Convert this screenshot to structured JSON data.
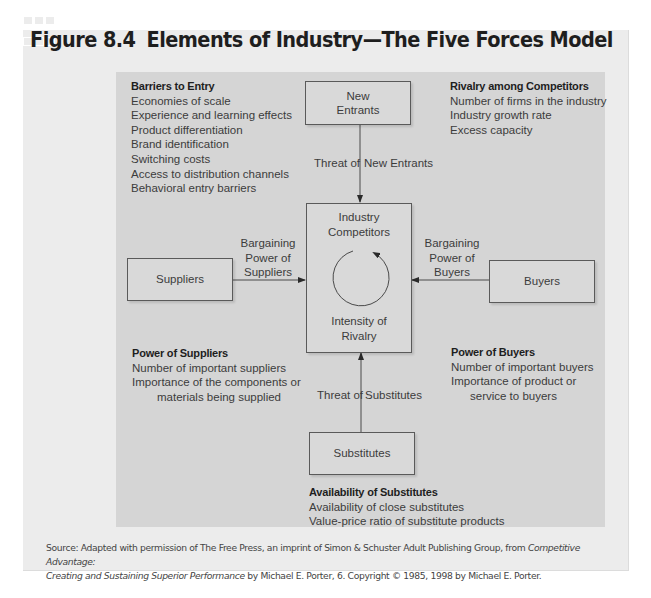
{
  "figure": {
    "number": "Figure 8.4",
    "title": "Elements of Industry—The Five Forces Model"
  },
  "nodes": {
    "new_entrants": [
      "New",
      "Entrants"
    ],
    "industry_competitors": [
      "Industry",
      "Competitors"
    ],
    "intensity": [
      "Intensity of",
      "Rivalry"
    ],
    "suppliers": "Suppliers",
    "buyers": "Buyers",
    "substitutes": "Substitutes"
  },
  "edges": {
    "threat_new_entrants": {
      "left": "Threat of",
      "right": "New Entrants"
    },
    "bargaining_suppliers": [
      "Bargaining",
      "Power of",
      "Suppliers"
    ],
    "bargaining_buyers": [
      "Bargaining",
      "Power of",
      "Buyers"
    ],
    "threat_substitutes": {
      "left": "Threat of",
      "right": "Substitutes"
    }
  },
  "lists": {
    "barriers_to_entry": {
      "heading": "Barriers to Entry",
      "items": [
        "Economies of scale",
        "Experience and learning effects",
        "Product differentiation",
        "Brand identification",
        "Switching costs",
        "Access to distribution channels",
        "Behavioral entry barriers"
      ]
    },
    "rivalry": {
      "heading": "Rivalry among Competitors",
      "items": [
        "Number of firms in the industry",
        "Industry growth rate",
        "Excess capacity"
      ]
    },
    "power_of_suppliers": {
      "heading": "Power of Suppliers",
      "items": [
        "Number of important suppliers",
        "Importance of the components or",
        "materials being supplied"
      ]
    },
    "power_of_buyers": {
      "heading": "Power of Buyers",
      "items": [
        "Number of important buyers",
        "Importance of product or",
        "service to buyers"
      ]
    },
    "substitutes": {
      "heading": "Availability of Substitutes",
      "items": [
        "Availability of close substitutes",
        "Value-price ratio of substitute products"
      ]
    }
  },
  "source": {
    "prefix": "Source: Adapted with permission of The Free Press, an imprint of Simon & Schuster Adult Publishing Group, from ",
    "book_title_line1": "Competitive Advantage:",
    "book_title_line2": "Creating and Sustaining Superior Performance",
    "suffix": " by Michael E. Porter, 6. Copyright © 1985, 1998 by Michael E. Porter."
  },
  "colors": {
    "outer_panel": "#ececec",
    "inner_panel": "#d5d5d5",
    "box_border": "#5a5a5a",
    "text": "#3c3c3c"
  }
}
